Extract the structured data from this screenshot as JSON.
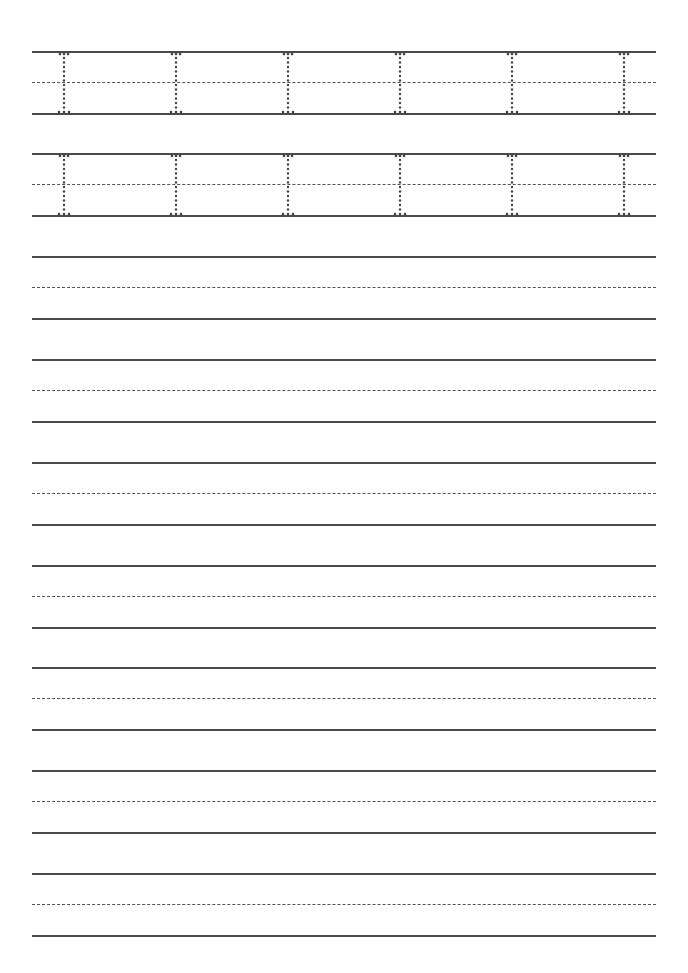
{
  "worksheet": {
    "title": "",
    "line_color": "#4a4a4a",
    "dot_color": "#444444",
    "rows": [
      {
        "top": 51,
        "tracing": true,
        "letter": "I",
        "glyph_x": [
          31,
          143,
          255,
          367,
          479,
          591
        ]
      },
      {
        "top": 153,
        "tracing": true,
        "letter": "I",
        "glyph_x": [
          31,
          143,
          255,
          367,
          479,
          591
        ]
      },
      {
        "top": 256,
        "tracing": false
      },
      {
        "top": 359,
        "tracing": false
      },
      {
        "top": 462,
        "tracing": false
      },
      {
        "top": 565,
        "tracing": false
      },
      {
        "top": 667,
        "tracing": false
      },
      {
        "top": 770,
        "tracing": false
      },
      {
        "top": 873,
        "tracing": false
      }
    ]
  }
}
